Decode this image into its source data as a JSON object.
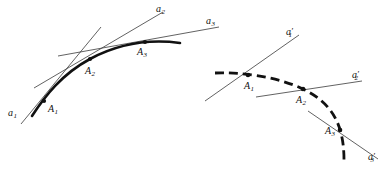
{
  "figure": {
    "background_color": "#ffffff",
    "stroke_color": "#111111",
    "thin_line_color": "#3a3a3a",
    "width": 385,
    "height": 184
  },
  "left_diagram": {
    "name": "solid-curve-diagram",
    "curve_style": "solid",
    "points": [
      {
        "id": "A1",
        "label": "A",
        "sub": "1",
        "x": 44,
        "y": 101,
        "label_x": 48,
        "label_y": 104
      },
      {
        "id": "A2",
        "label": "A",
        "sub": "2",
        "x": 90,
        "y": 59,
        "label_x": 85,
        "label_y": 66
      },
      {
        "id": "A3",
        "label": "A",
        "sub": "3",
        "x": 145,
        "y": 42,
        "label_x": 137,
        "label_y": 48
      }
    ],
    "tangents": [
      {
        "id": "a1",
        "label": "a",
        "sub": "1",
        "prime": "",
        "label_x": 8,
        "label_y": 108
      },
      {
        "id": "a2",
        "label": "a",
        "sub": "2",
        "prime": "",
        "label_x": 156,
        "label_y": 4
      },
      {
        "id": "a3",
        "label": "a",
        "sub": "3",
        "prime": "",
        "label_x": 206,
        "label_y": 16
      }
    ]
  },
  "right_diagram": {
    "name": "dashed-curve-diagram",
    "curve_style": "dashed",
    "points": [
      {
        "id": "A1p",
        "label": "A",
        "sub": "1",
        "x": 248,
        "y": 75,
        "label_x": 244,
        "label_y": 81
      },
      {
        "id": "A2p",
        "label": "A",
        "sub": "2",
        "x": 303,
        "y": 89,
        "label_x": 296,
        "label_y": 95
      },
      {
        "id": "A3p",
        "label": "A",
        "sub": "3",
        "x": 341,
        "y": 130,
        "label_x": 325,
        "label_y": 127
      }
    ],
    "tangents": [
      {
        "id": "a1p",
        "label": "a",
        "sub": "1",
        "prime": "′",
        "label_x": 286,
        "label_y": 27
      },
      {
        "id": "a2p",
        "label": "a",
        "sub": "2",
        "prime": "′",
        "label_x": 352,
        "label_y": 70
      },
      {
        "id": "a3p",
        "label": "a",
        "sub": "3",
        "prime": "′",
        "label_x": 368,
        "label_y": 152
      }
    ]
  }
}
